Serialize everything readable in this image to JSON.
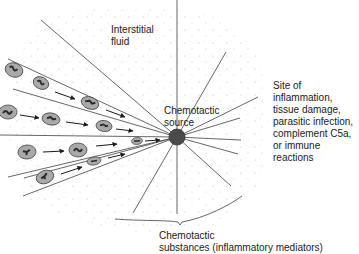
{
  "diagram": {
    "colors": {
      "background": "#ffffff",
      "line": "#555555",
      "stipple": "#b8b8b8",
      "cell_body": "#a9a9a9",
      "cell_outline": "#444444",
      "nucleus": "#2a2a2a",
      "source": "#4a4a4a",
      "text": "#1a1a1a"
    },
    "labels": {
      "interstitial_fluid": "Interstitial\nfluid",
      "chemotactic_source": "Chemotactic\nsource",
      "site": "Site of inflammation,\ntissue damage,\nparasitic infection,\ncomplement C5a,\nor immune reactions",
      "substances": "Chemotactic\nsubstances (inflammatory mediators)"
    },
    "source_point": {
      "x": 177,
      "y": 137,
      "r": 8
    },
    "cell_count": 14,
    "arrow_count": 10
  }
}
